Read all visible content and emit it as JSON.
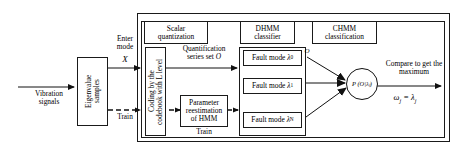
{
  "inputs": {
    "vibration_signals": "Vibration\nsignals",
    "eigenvalue_samples": "Eigenvalue\nsamples",
    "enter_mode_label": "Enter\nmode",
    "enter_mode_symbol": "X",
    "train_label": "Train"
  },
  "stage1": {
    "header": "Scalar\nquantization",
    "coding_box": "Coding by the\ncodebook with L level",
    "quantification_label": "Quantification\nseries set O",
    "parameter_box": "Parameter\nreestimation\nof HMM",
    "parameter_train_label": "Train"
  },
  "stage2": {
    "header": "DHMM\nclassifier",
    "modes": [
      {
        "label": "Fault mode",
        "symbol": "λ",
        "index": "0"
      },
      {
        "label": "Fault mode",
        "symbol": "λ",
        "index": "1"
      },
      {
        "label": "Fault mode",
        "symbol": "λ",
        "index": "N"
      }
    ]
  },
  "stage3": {
    "header": "CHMM\nclassification",
    "observation_symbol": "O",
    "probability_node": "P (O|λⱼ)",
    "compare_label": "Compare to get the\nmaximum",
    "output_label": "ωⱼ = λⱼ"
  },
  "style": {
    "stroke": "#1a1a1a",
    "background": "#ffffff",
    "text": "#000000"
  }
}
